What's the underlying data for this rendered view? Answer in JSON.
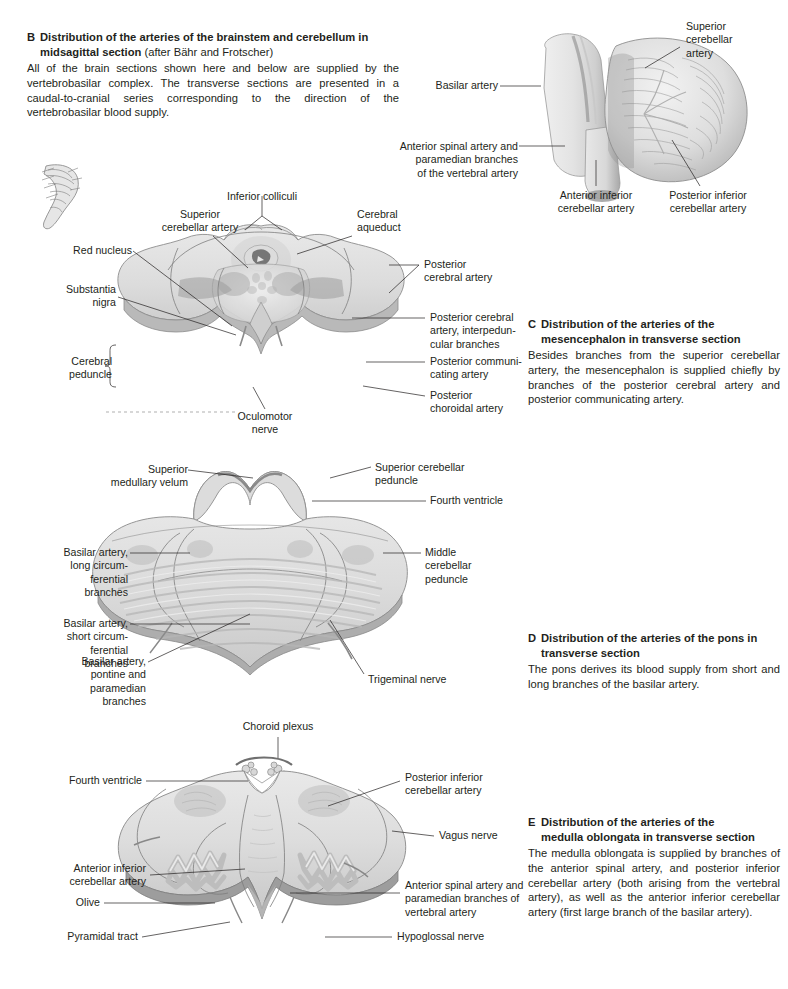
{
  "page": {
    "background": "#ffffff",
    "text_color": "#231f20"
  },
  "captions": {
    "b": {
      "letter": "B",
      "heading_line1": "Distribution of the arteries of the brainstem and cerebellum in",
      "heading_line2": "midsagittal section",
      "heading_suffix": " (after Bähr and Frotscher)",
      "body": "All of the brain sections shown here and below are supplied by the vertebrobasilar complex. The transverse sections are presented in a caudal-to-cranial series corresponding to the direction of the vertebrobasilar blood supply."
    },
    "c": {
      "letter": "C",
      "heading_line1": "Distribution of the arteries of the",
      "heading_line2": "mesencephalon in transverse section",
      "body": "Besides branches from the superior cerebellar artery, the mesencephalon is supplied chiefly by branches of the posterior cerebral artery and posterior communicating artery."
    },
    "d": {
      "letter": "D",
      "heading_line1": "Distribution of the arteries of the pons in",
      "heading_line2": "transverse section",
      "body": "The pons derives its blood supply from short and long branches of the basilar artery."
    },
    "e": {
      "letter": "E",
      "heading_line1": "Distribution of the arteries of the",
      "heading_line2": "medulla oblongata in transverse section",
      "body": "The medulla oblongata is supplied by branches of the anterior spinal artery, and posterior inferior cerebellar artery (both arising from the vertebral artery), as well as the anterior inferior cerebellar artery (first large branch of the basilar artery)."
    }
  },
  "figure_b": {
    "name": "brainstem-cerebellum-midsagittal",
    "labels": {
      "superior_cerebellar_artery": "Superior\ncerebellar\nartery",
      "basilar_artery": "Basilar artery",
      "anterior_spinal_artery": "Anterior spinal artery and\nparamedian branches\nof the vertebral artery",
      "anterior_inferior_cerebellar_artery": "Anterior inferior\ncerebellar artery",
      "posterior_inferior_cerebellar_artery": "Posterior inferior\ncerebellar artery"
    }
  },
  "figure_c": {
    "name": "mesencephalon-transverse-section",
    "labels": {
      "superior_cerebellar_artery": "Superior\ncerebellar artery",
      "inferior_colliculi": "Inferior colliculi",
      "cerebral_aqueduct": "Cerebral\naqueduct",
      "red_nucleus": "Red nucleus",
      "substantia_nigra": "Substantia\nnigra",
      "cerebral_peduncle": "Cerebral\npeduncle",
      "posterior_cerebral_artery": "Posterior\ncerebral artery",
      "posterior_cerebral_artery_interpeduncular": "Posterior cerebral\nartery, interpedun-\ncular branches",
      "posterior_communicating_artery": "Posterior communi-\ncating artery",
      "posterior_choroidal_artery": "Posterior\nchoroidal artery",
      "oculomotor_nerve": "Oculomotor\nnerve"
    }
  },
  "figure_d": {
    "name": "pons-transverse-section",
    "labels": {
      "superior_medullary_velum": "Superior\nmedullary velum",
      "superior_cerebellar_peduncle": "Superior cerebellar\npeduncle",
      "fourth_ventricle": "Fourth ventricle",
      "middle_cerebellar_peduncle": "Middle\ncerebellar\npeduncle",
      "basilar_long_circumferential": "Basilar artery,\nlong circum-\nferential\nbranches",
      "basilar_short_circumferential": "Basilar artery,\nshort circum-\nferential\nbranches",
      "basilar_pontine_paramedian": "Basilar artery,\npontine and\nparamedian\nbranches",
      "trigeminal_nerve": "Trigeminal nerve"
    }
  },
  "figure_e": {
    "name": "medulla-oblongata-transverse-section",
    "labels": {
      "choroid_plexus": "Choroid plexus",
      "fourth_ventricle": "Fourth ventricle",
      "posterior_inferior_cerebellar_artery": "Posterior inferior\ncerebellar artery",
      "vagus_nerve": "Vagus nerve",
      "anterior_inferior_cerebellar_artery": "Anterior inferior\ncerebellar artery",
      "olive": "Olive",
      "pyramidal_tract": "Pyramidal tract",
      "anterior_spinal_artery": "Anterior spinal artery and\nparamedian branches of\nvertebral artery",
      "hypoglossal_nerve": "Hypoglossal nerve"
    }
  }
}
